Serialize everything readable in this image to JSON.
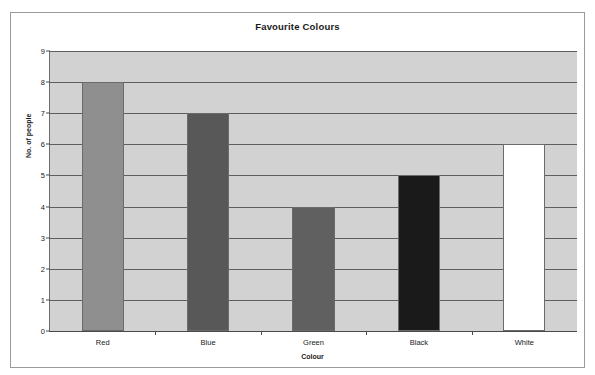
{
  "chart_data": {
    "type": "bar",
    "title": "Favourite Colours",
    "xlabel": "Colour",
    "ylabel": "No. of people",
    "categories": [
      "Red",
      "Blue",
      "Green",
      "Black",
      "White"
    ],
    "values": [
      8,
      7,
      4,
      5,
      6
    ],
    "ylim": [
      0,
      9
    ],
    "ytick_labels": [
      "0",
      "1",
      "2",
      "3",
      "4",
      "5",
      "6",
      "7",
      "8",
      "9"
    ],
    "ytick_values": [
      0,
      1,
      2,
      3,
      4,
      5,
      6,
      7,
      8,
      9
    ],
    "grid": true,
    "legend": "none",
    "plot_background": "#d2d2d2",
    "gridline_color": "#5e5e5e",
    "bar_colors": [
      "#8f8f8f",
      "#585858",
      "#606060",
      "#1a1a1a",
      "#ffffff"
    ],
    "bar_border_color": "#6b6b6b"
  }
}
